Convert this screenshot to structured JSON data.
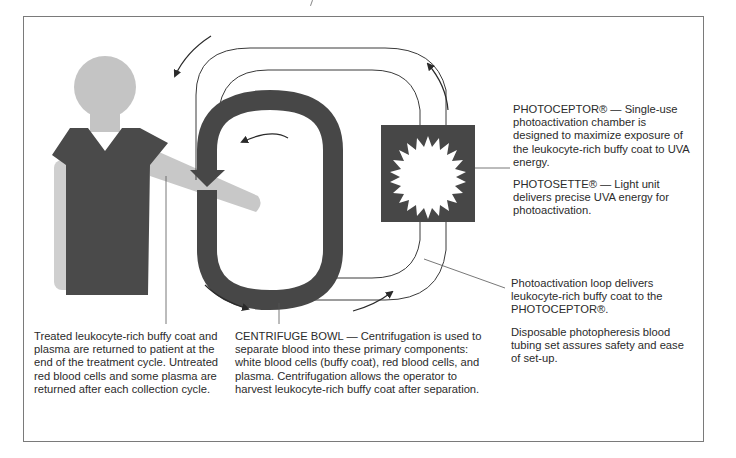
{
  "figure": {
    "colors": {
      "dark_component": "#474747",
      "patient_skin": "#c4c4c4",
      "patient_shirt": "#4a4a4a",
      "line": "#3a3a3a",
      "frame": "#7a7a7a"
    },
    "elements": [
      {
        "id": "patient",
        "label": "Patient figure"
      },
      {
        "id": "centrifuge-bowl",
        "label": "CENTRIFUGE BOWL"
      },
      {
        "id": "photoceptor",
        "label": "PHOTOCEPTOR® / PHOTOSETTE®"
      },
      {
        "id": "photoactivation-loop",
        "label": "Photoactivation loop"
      }
    ]
  },
  "captions": {
    "photoceptor": "PHOTOCEPTOR® — Single-use photoactivation chamber is designed to maximize exposure of the leukocyte-rich buffy coat to UVA energy.",
    "photosette": "PHOTOSETTE® — Light unit delivers precise UVA energy for photoactivation.",
    "loop": "Photoactivation loop delivers leukocyte-rich buffy coat to the PHOTOCEPTOR®.",
    "tubing": "Disposable photopheresis blood tubing set assures safety and ease of set-up.",
    "patient": "Treated leukocyte-rich buffy coat and plasma are returned to patient at the end of the treatment cycle. Untreated red blood cells and some plasma are returned after each collection cycle.",
    "bowl": "CENTRIFUGE BOWL — Centrifugation is used to separate blood into these primary components: white blood cells (buffy coat), red blood cells, and plasma. Centrifugation allows the operator to harvest leukocyte-rich buffy coat after separation."
  }
}
